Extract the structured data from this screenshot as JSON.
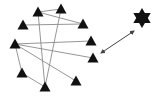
{
  "diagram": {
    "colors": {
      "node": "#111111",
      "edge": "#8a8a8a",
      "arrow": "#444444",
      "star": "#111111"
    },
    "nodes": [
      {
        "id": "t1",
        "shape": "triangle",
        "x": 38,
        "y": 12
      },
      {
        "id": "t2",
        "shape": "triangle",
        "x": 61,
        "y": 9
      },
      {
        "id": "t3",
        "shape": "triangle",
        "x": 23,
        "y": 25
      },
      {
        "id": "t4",
        "shape": "triangle",
        "x": 83,
        "y": 24
      },
      {
        "id": "t5",
        "shape": "triangle",
        "x": 15,
        "y": 44
      },
      {
        "id": "t6",
        "shape": "triangle",
        "x": 91,
        "y": 41
      },
      {
        "id": "t7",
        "shape": "triangle",
        "x": 93,
        "y": 58
      },
      {
        "id": "t8",
        "shape": "triangle",
        "x": 22,
        "y": 73
      },
      {
        "id": "t9",
        "shape": "triangle",
        "x": 76,
        "y": 81
      },
      {
        "id": "t10",
        "shape": "triangle",
        "x": 45,
        "y": 87
      }
    ],
    "edges": [
      [
        "t1",
        "t2"
      ],
      [
        "t1",
        "t4"
      ],
      [
        "t3",
        "t4"
      ],
      [
        "t5",
        "t6"
      ],
      [
        "t5",
        "t7"
      ],
      [
        "t5",
        "t9"
      ],
      [
        "t5",
        "t8"
      ],
      [
        "t1",
        "t10"
      ],
      [
        "t2",
        "t10"
      ],
      [
        "t8",
        "t10"
      ]
    ],
    "star": {
      "id": "star",
      "shape": "six-pointed-star",
      "x": 142,
      "y": 18
    },
    "double_arrow": {
      "x1": 101,
      "y1": 53,
      "x2": 134,
      "y2": 31
    }
  }
}
